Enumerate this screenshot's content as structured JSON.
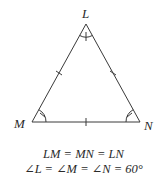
{
  "diagram": {
    "type": "equilateral-triangle",
    "vertices": {
      "L": {
        "label": "L",
        "x": 86,
        "y": 24
      },
      "M": {
        "label": "M",
        "x": 32,
        "y": 122
      },
      "N": {
        "label": "N",
        "x": 140,
        "y": 122
      }
    },
    "side_tick_marks": 1,
    "angle_arc_marks": 1,
    "stroke_color": "#3a3a3a"
  },
  "caption": {
    "line1": "LM = MN = LN",
    "line2": "∠L = ∠M = ∠N = 60°"
  }
}
